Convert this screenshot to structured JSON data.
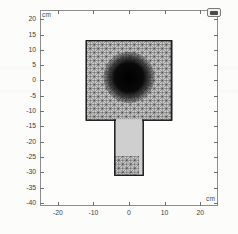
{
  "figure": {
    "title": "",
    "y_unit_label": "cm",
    "x_unit_label": "cm",
    "corner_icon": "window-icon"
  },
  "chart_data": {
    "type": "scatter",
    "plot_kind": "finite-element-mesh-2d",
    "title": "",
    "xlabel": "cm",
    "ylabel": "cm",
    "xlim": [
      -25,
      25
    ],
    "ylim": [
      -41,
      23
    ],
    "grid": false,
    "legend": null,
    "xticks": [
      -20,
      -10,
      0,
      10,
      20
    ],
    "xticklabels": [
      "-20",
      "-10",
      "0",
      "10",
      "20"
    ],
    "yticks": [
      20,
      15,
      10,
      5,
      0,
      -5,
      -10,
      -15,
      -20,
      -25,
      -30,
      -35,
      -40
    ],
    "yticklabels": [
      "20",
      "15",
      "10",
      "5",
      "0",
      "-5",
      "-10",
      "-15",
      "-20",
      "-25",
      "-30",
      "-35",
      "-40"
    ],
    "regions": [
      {
        "name": "head-square",
        "shape": "rectangle",
        "x_range": [
          -12,
          12
        ],
        "y_range": [
          -13,
          13
        ],
        "mesh": "triangular",
        "density": "medium"
      },
      {
        "name": "stem-rectangle",
        "shape": "rectangle",
        "x_range": [
          -4,
          4
        ],
        "y_range": [
          -31,
          -13
        ],
        "mesh": "triangular",
        "density": "medium"
      },
      {
        "name": "refined-disc",
        "shape": "circle",
        "center": [
          0,
          1
        ],
        "radius": 7,
        "mesh": "triangular",
        "density": "very-high"
      }
    ]
  }
}
